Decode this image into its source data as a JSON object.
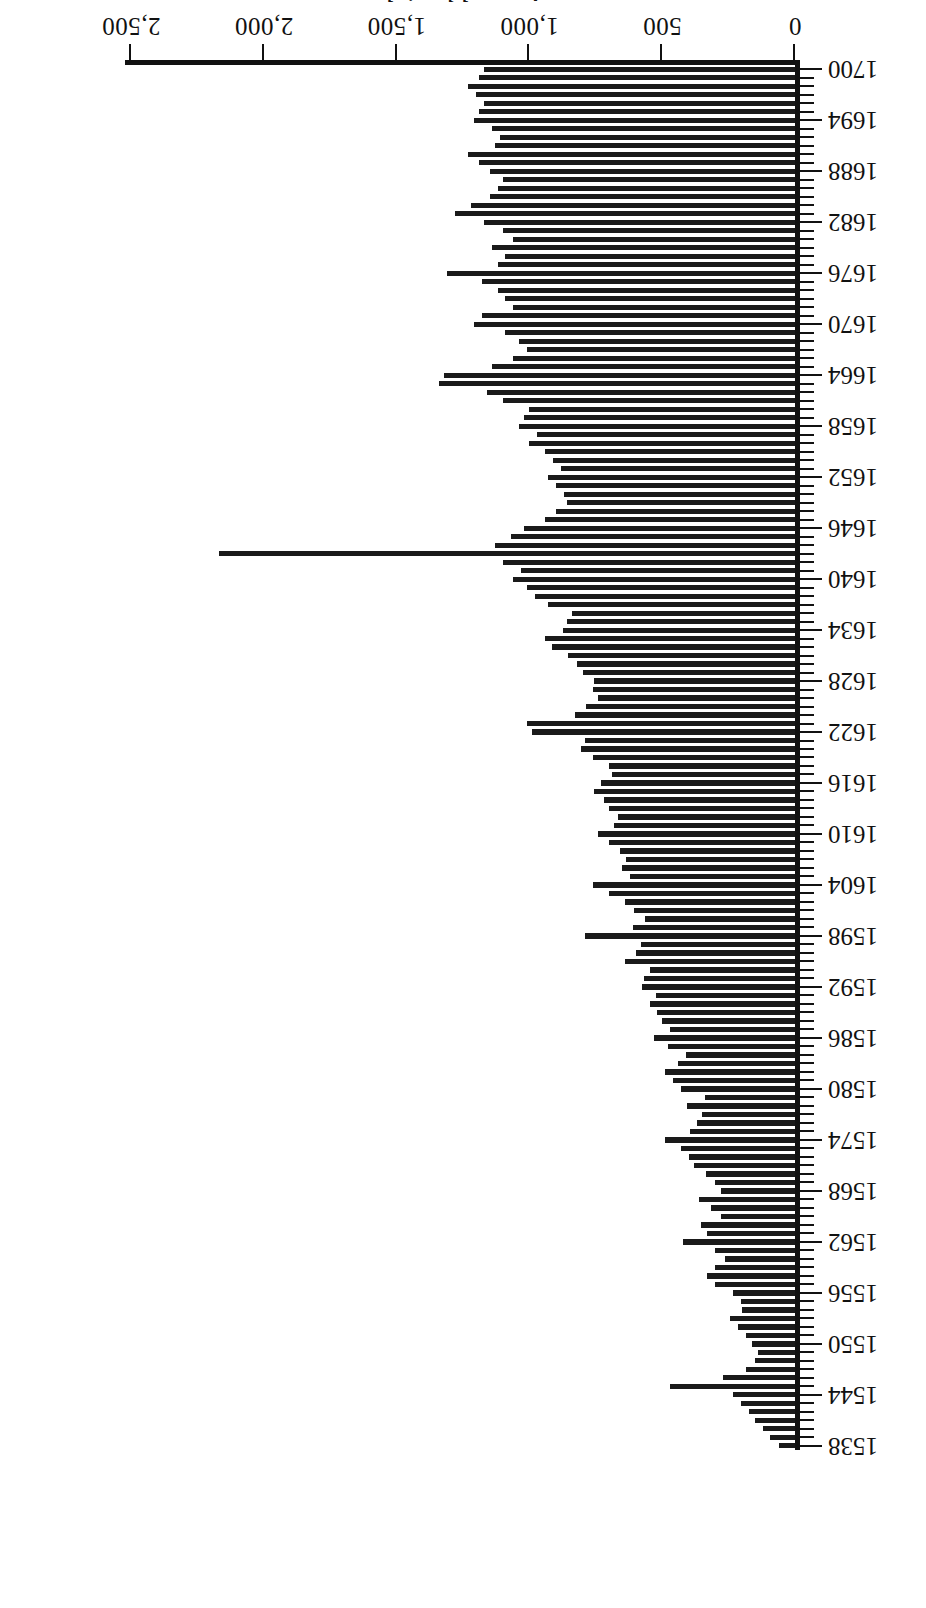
{
  "figure": {
    "orientation": "rotated-180",
    "background_color": "#ffffff",
    "bar_color": "#1a1a1a",
    "axis_color": "#111111"
  },
  "axes": {
    "value_axis_title": "Annual burials",
    "value_ticks": [
      "0",
      "500",
      "1,000",
      "1,500",
      "2,000",
      "2,500"
    ],
    "category_ticks": [
      "1538",
      "1544",
      "1550",
      "1556",
      "1562",
      "1568",
      "1574",
      "1580",
      "1586",
      "1592",
      "1598",
      "1604",
      "1610",
      "1616",
      "1622",
      "1628",
      "1634",
      "1640",
      "1646",
      "1652",
      "1658",
      "1664",
      "1670",
      "1676",
      "1682",
      "1688",
      "1694",
      "1700"
    ]
  },
  "chart_data": {
    "type": "bar",
    "title": "",
    "subtitle": "",
    "xlabel": "",
    "ylabel": "Annual burials",
    "ylim": [
      0,
      2500
    ],
    "grid": false,
    "legend": null,
    "orientation": "vertical",
    "tick_interval_years": 6,
    "categories": [
      1538,
      1539,
      1540,
      1541,
      1542,
      1543,
      1544,
      1545,
      1546,
      1547,
      1548,
      1549,
      1550,
      1551,
      1552,
      1553,
      1554,
      1555,
      1556,
      1557,
      1558,
      1559,
      1560,
      1561,
      1562,
      1563,
      1564,
      1565,
      1566,
      1567,
      1568,
      1569,
      1570,
      1571,
      1572,
      1573,
      1574,
      1575,
      1576,
      1577,
      1578,
      1579,
      1580,
      1581,
      1582,
      1583,
      1584,
      1585,
      1586,
      1587,
      1588,
      1589,
      1590,
      1591,
      1592,
      1593,
      1594,
      1595,
      1596,
      1597,
      1598,
      1599,
      1600,
      1601,
      1602,
      1603,
      1604,
      1605,
      1606,
      1607,
      1608,
      1609,
      1610,
      1611,
      1612,
      1613,
      1614,
      1615,
      1616,
      1617,
      1618,
      1619,
      1620,
      1621,
      1622,
      1623,
      1624,
      1625,
      1626,
      1627,
      1628,
      1629,
      1630,
      1631,
      1632,
      1633,
      1634,
      1635,
      1636,
      1637,
      1638,
      1639,
      1640,
      1641,
      1642,
      1643,
      1644,
      1645,
      1646,
      1647,
      1648,
      1649,
      1650,
      1651,
      1652,
      1653,
      1654,
      1655,
      1656,
      1657,
      1658,
      1659,
      1660,
      1661,
      1662,
      1663,
      1664,
      1665,
      1666,
      1667,
      1668,
      1669,
      1670,
      1671,
      1672,
      1673,
      1674,
      1675,
      1676,
      1677,
      1678,
      1679,
      1680,
      1681,
      1682,
      1683,
      1684,
      1685,
      1686,
      1687,
      1688,
      1689,
      1690,
      1691,
      1692,
      1693,
      1694,
      1695,
      1696,
      1697,
      1698,
      1699,
      1700
    ],
    "values": [
      60,
      95,
      120,
      150,
      175,
      205,
      235,
      470,
      270,
      185,
      150,
      140,
      160,
      185,
      215,
      245,
      200,
      205,
      235,
      300,
      330,
      300,
      265,
      300,
      420,
      330,
      355,
      280,
      315,
      360,
      280,
      300,
      335,
      380,
      400,
      430,
      490,
      395,
      370,
      350,
      405,
      340,
      430,
      460,
      490,
      440,
      410,
      480,
      530,
      470,
      500,
      520,
      545,
      525,
      575,
      570,
      545,
      640,
      600,
      580,
      790,
      610,
      565,
      605,
      640,
      700,
      760,
      620,
      650,
      635,
      660,
      700,
      740,
      680,
      665,
      700,
      720,
      755,
      730,
      690,
      700,
      760,
      805,
      790,
      990,
      1010,
      830,
      785,
      740,
      760,
      755,
      800,
      820,
      855,
      915,
      940,
      875,
      860,
      840,
      930,
      980,
      1010,
      1060,
      1030,
      1100,
      2170,
      1130,
      1070,
      1020,
      940,
      900,
      860,
      870,
      900,
      930,
      880,
      910,
      940,
      1000,
      970,
      1040,
      1020,
      1000,
      1100,
      1160,
      1340,
      1320,
      1140,
      1060,
      1010,
      1040,
      1090,
      1210,
      1180,
      1060,
      1090,
      1120,
      1180,
      1310,
      1120,
      1090,
      1140,
      1060,
      1100,
      1170,
      1280,
      1220,
      1150,
      1120,
      1100,
      1150,
      1190,
      1230,
      1130,
      1110,
      1140,
      1210,
      1190,
      1170,
      1200,
      1230,
      1190,
      1170
    ]
  },
  "caption": {
    "text": ""
  }
}
